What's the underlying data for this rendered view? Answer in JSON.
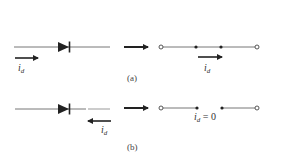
{
  "figure": {
    "panel_a": {
      "caption": "(a)",
      "current_label": "i",
      "current_sub": "d",
      "equiv_current_label": "i",
      "equiv_current_sub": "d",
      "description": "Forward-biased diode equivalent: short circuit (closed switch)"
    },
    "panel_b": {
      "caption": "(b)",
      "current_label": "i",
      "current_sub": "d",
      "equiv_label": "i",
      "equiv_sub": "d",
      "equiv_value": " = 0",
      "description": "Reverse-biased diode equivalent: open circuit"
    },
    "colors": {
      "ink": "#222222",
      "wire": "#777777"
    }
  }
}
